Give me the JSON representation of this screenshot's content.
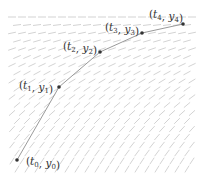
{
  "diagram": {
    "colors": {
      "field": "#c8c8c8",
      "path": "#9a9a9a",
      "point": "#333333",
      "text": "#333333"
    },
    "field": {
      "x_start": 12,
      "x_end": 196,
      "x_step": 10,
      "y_start": 17,
      "y_end": 176,
      "y_step": 8,
      "seg_len": 8,
      "angle_top_deg": 0,
      "angle_bottom_deg": 60
    },
    "points": [
      {
        "id": "p0",
        "x": 17,
        "y": 160,
        "label": "(t0, y0)",
        "t": "t",
        "tsub": "0",
        "y_": "y",
        "ysub": "0",
        "lx": 26,
        "ly": 165
      },
      {
        "id": "p1",
        "x": 59,
        "y": 87,
        "label": "(t1, y1)",
        "t": "t",
        "tsub": "1",
        "y_": "y",
        "ysub": "1",
        "lx": 19,
        "ly": 89
      },
      {
        "id": "p2",
        "x": 100,
        "y": 52,
        "label": "(t2, y2)",
        "t": "t",
        "tsub": "2",
        "y_": "y",
        "ysub": "2",
        "lx": 63,
        "ly": 50
      },
      {
        "id": "p3",
        "x": 142,
        "y": 33,
        "label": "(t3, y3)",
        "t": "t",
        "tsub": "3",
        "y_": "y",
        "ysub": "3",
        "lx": 105,
        "ly": 31
      },
      {
        "id": "p4",
        "x": 183,
        "y": 24,
        "label": "(t4, y4)",
        "t": "t",
        "tsub": "4",
        "y_": "y",
        "ysub": "4",
        "lx": 149,
        "ly": 18
      }
    ]
  }
}
